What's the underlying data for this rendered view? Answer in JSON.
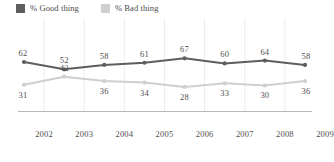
{
  "legend": {
    "entries": [
      {
        "label": "% Good thing",
        "color": "#5e5e5e",
        "icon": "legend-swatch-good"
      },
      {
        "label": "% Bad thing",
        "color": "#cfcfcf",
        "icon": "legend-swatch-bad"
      }
    ]
  },
  "axis": {
    "ticks": [
      "2002",
      "2003",
      "2004",
      "2005",
      "2006",
      "2007",
      "2008",
      "2009"
    ]
  },
  "chart_data": {
    "type": "line",
    "title": "",
    "xlabel": "",
    "ylabel": "",
    "ylim": [
      0,
      100
    ],
    "grid": true,
    "legend_position": "top-left",
    "categories": [
      "2002",
      "2003",
      "2004",
      "2005",
      "2006",
      "2007",
      "2008",
      "2009"
    ],
    "series": [
      {
        "name": "% Good thing",
        "color": "#5e5e5e",
        "values": [
          62,
          52,
          58,
          61,
          67,
          60,
          64,
          58
        ],
        "labels": [
          "62",
          "52",
          "58",
          "61",
          "67",
          "60",
          "64",
          "58"
        ]
      },
      {
        "name": "% Bad thing",
        "color": "#cfcfcf",
        "values": [
          31,
          42,
          36,
          34,
          28,
          33,
          30,
          36
        ],
        "labels": [
          "31",
          "42",
          "36",
          "34",
          "28",
          "33",
          "30",
          "36"
        ]
      }
    ]
  }
}
